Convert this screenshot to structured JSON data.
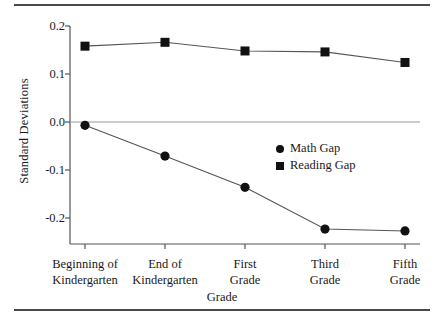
{
  "chart_data": {
    "type": "line",
    "title": "",
    "xlabel": "Grade",
    "ylabel": "Standard Deviations",
    "categories": [
      "Beginning of Kindergarten",
      "End of Kindergarten",
      "First Grade",
      "Third Grade",
      "Fifth Grade"
    ],
    "category_lines": [
      [
        "Beginning of",
        "Kindergarten"
      ],
      [
        "End of",
        "Kindergarten"
      ],
      [
        "First",
        "Grade"
      ],
      [
        "Third",
        "Grade"
      ],
      [
        "Fifth",
        "Grade"
      ]
    ],
    "series": [
      {
        "name": "Math Gap",
        "marker": "circle",
        "values": [
          -0.007,
          -0.071,
          -0.136,
          -0.223,
          -0.227
        ]
      },
      {
        "name": "Reading Gap",
        "marker": "square",
        "values": [
          0.158,
          0.166,
          0.148,
          0.146,
          0.124
        ]
      }
    ],
    "ylim": [
      -0.24,
      0.2
    ],
    "yticks": [
      0.2,
      0.1,
      0.0,
      -0.1,
      -0.2
    ],
    "ytick_labels": [
      "0.2",
      "0.1",
      "0.0",
      "-0.1",
      "-0.2"
    ],
    "zero_line": true,
    "grid": false,
    "legend_position": "center-right",
    "line_color": "#555555",
    "marker_color": "#111111",
    "axis_color": "#555555"
  },
  "axis": {
    "ylabel": "Standard Deviations",
    "xlabel": "Grade",
    "ytick_labels": [
      "0.2",
      "0.1",
      "0.0",
      "-0.1",
      "-0.2"
    ]
  },
  "legend": {
    "entries": [
      {
        "label": "Math Gap",
        "marker": "circle"
      },
      {
        "label": "Reading Gap",
        "marker": "square"
      }
    ]
  }
}
